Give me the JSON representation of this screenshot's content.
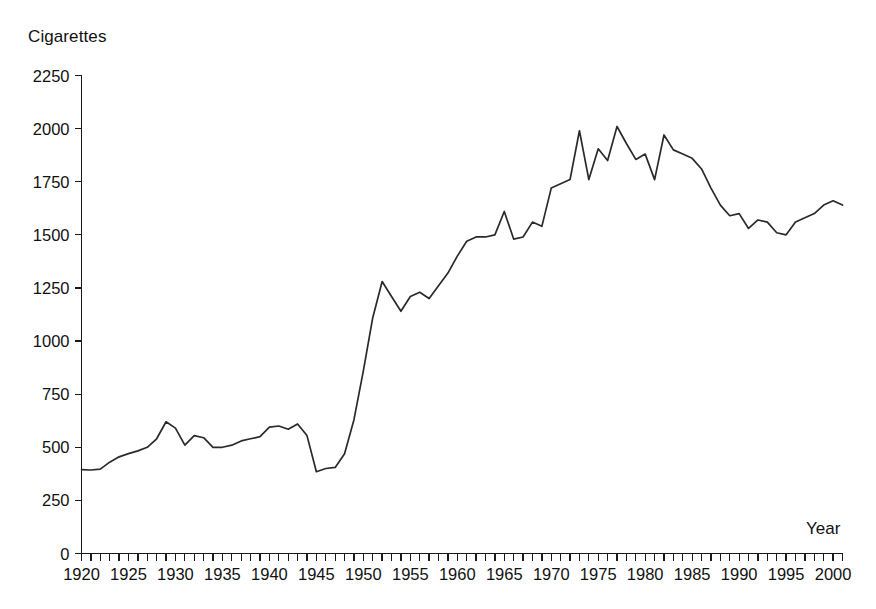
{
  "chart_data": {
    "type": "line",
    "title": "",
    "ylabel": "Cigarettes",
    "xlabel": "Year",
    "ylim": [
      0,
      2250
    ],
    "xlim": [
      1920,
      2001
    ],
    "grid": false,
    "legend": null,
    "y_ticks": [
      0,
      250,
      500,
      750,
      1000,
      1250,
      1500,
      1750,
      2000,
      2250
    ],
    "y_tick_labels": [
      "0",
      "250",
      "500",
      "750",
      "1000",
      "1250",
      "1500",
      "1750",
      "2000",
      "2250"
    ],
    "x_tick_labels": [
      "1920",
      "1925",
      "1930",
      "1935",
      "1940",
      "1945",
      "1950",
      "1955",
      "1960",
      "1965",
      "1970",
      "1975",
      "1980",
      "1985",
      "1990",
      "1995",
      "2000"
    ],
    "x_tick_step_minor": 1,
    "x_tick_step_major": 5,
    "series": [
      {
        "name": "Cigarettes",
        "x": [
          1920,
          1921,
          1922,
          1923,
          1924,
          1925,
          1926,
          1927,
          1928,
          1929,
          1930,
          1931,
          1932,
          1933,
          1934,
          1935,
          1936,
          1937,
          1938,
          1939,
          1940,
          1941,
          1942,
          1943,
          1944,
          1945,
          1946,
          1947,
          1948,
          1949,
          1950,
          1951,
          1952,
          1953,
          1954,
          1955,
          1956,
          1957,
          1958,
          1959,
          1960,
          1961,
          1962,
          1963,
          1964,
          1965,
          1966,
          1967,
          1968,
          1969,
          1970,
          1971,
          1972,
          1973,
          1974,
          1975,
          1976,
          1977,
          1978,
          1979,
          1980,
          1981,
          1982,
          1983,
          1984,
          1985,
          1986,
          1987,
          1988,
          1989,
          1990,
          1991,
          1992,
          1993,
          1994,
          1995,
          1996,
          1997,
          1998,
          1999,
          2000,
          2001
        ],
        "y": [
          395,
          393,
          397,
          430,
          455,
          470,
          483,
          500,
          540,
          620,
          590,
          510,
          555,
          545,
          500,
          500,
          510,
          530,
          540,
          550,
          595,
          600,
          585,
          610,
          555,
          385,
          400,
          405,
          470,
          630,
          860,
          1110,
          1280,
          1210,
          1140,
          1210,
          1230,
          1200,
          1260,
          1320,
          1400,
          1470,
          1490,
          1490,
          1500,
          1610,
          1480,
          1490,
          1560,
          1540,
          1720,
          1740,
          1760,
          1990,
          1760,
          1905,
          1850,
          2010,
          1930,
          1855,
          1880,
          1760,
          1970,
          1900,
          1880,
          1860,
          1810,
          1720,
          1640,
          1590,
          1600,
          1530,
          1570,
          1560,
          1510,
          1500,
          1560,
          1580,
          1600,
          1640,
          1660,
          1640
        ]
      }
    ]
  },
  "axis": {
    "y_title": "Cigarettes",
    "x_title": "Year"
  }
}
